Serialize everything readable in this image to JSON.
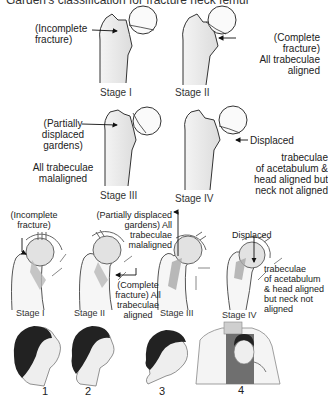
{
  "title": "Garden's classification for fracture neck femur",
  "top_diagrams": [
    {
      "stage": "Stage I",
      "annotation": "(Incomplete\nfracture)"
    },
    {
      "stage": "Stage II",
      "annotation": "(Complete\nfracture)\nAll trabeculae\naligned"
    },
    {
      "stage": "Stage III",
      "annotation": "(Partially\ndisplaced\ngardens)",
      "note": "All trabeculae\nmalaligned"
    },
    {
      "stage": "Stage IV",
      "annotation": "Displaced",
      "note": "trabeculae\nof acetabulum &\nhead aligned but\nneck not aligned"
    }
  ],
  "middle_diagrams": [
    {
      "stage": "Stage I",
      "annotation": "(Incomplete\nfracture)"
    },
    {
      "stage": "Stage II",
      "annotation": "(Complete\nfracture) All\ntrabeculae\naligned"
    },
    {
      "stage": "Stage III",
      "annotation": "(Partially displaced\ngardens) All\ntrabeculae\nmalaligned"
    },
    {
      "stage": "Stage IV",
      "annotation": "Displaced",
      "note": "trabeculae\nof acetabulum\n& head aligned\nbut neck not\naligned"
    }
  ],
  "heads": [
    {
      "label": "1"
    },
    {
      "label": "2"
    },
    {
      "label": "3"
    },
    {
      "label": "4"
    }
  ]
}
